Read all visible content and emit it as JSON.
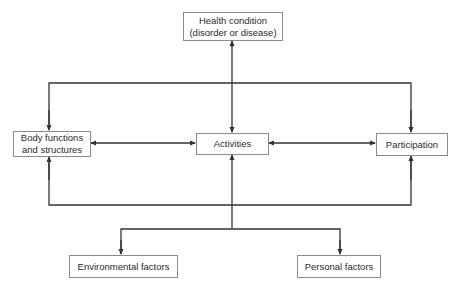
{
  "diagram": {
    "type": "flow",
    "colors": {
      "line": "#333333",
      "border": "#8a8a8a",
      "text": "#2a2a2a",
      "background": "#ffffff"
    },
    "nodes": {
      "health_condition": {
        "label": "Health condition\n(disorder or disease)"
      },
      "body_functions": {
        "label": "Body functions\nand structures"
      },
      "activities": {
        "label": "Activities"
      },
      "participation": {
        "label": "Participation"
      },
      "environmental_factors": {
        "label": "Environmental factors"
      },
      "personal_factors": {
        "label": "Personal factors"
      }
    },
    "edges": [
      {
        "from": "health_condition",
        "to": "activities",
        "direction": "both"
      },
      {
        "from": "body_functions",
        "to": "activities",
        "direction": "both"
      },
      {
        "from": "activities",
        "to": "participation",
        "direction": "both"
      },
      {
        "from": "top_bus",
        "to": "body_functions",
        "direction": "forward"
      },
      {
        "from": "top_bus",
        "to": "participation",
        "direction": "forward"
      },
      {
        "from": "bottom_bus",
        "to": "body_functions",
        "direction": "forward"
      },
      {
        "from": "bottom_bus",
        "to": "participation",
        "direction": "forward"
      },
      {
        "from": "factors_bus",
        "to": "activities",
        "direction": "forward"
      },
      {
        "from": "factors_bus",
        "to": "environmental_factors",
        "direction": "forward"
      },
      {
        "from": "factors_bus",
        "to": "personal_factors",
        "direction": "forward"
      }
    ]
  }
}
